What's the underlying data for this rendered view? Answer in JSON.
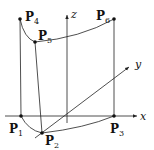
{
  "diagram": {
    "type": "3d-coordinate-surface-patch",
    "axes": {
      "x": {
        "label": "x"
      },
      "y": {
        "label": "y"
      },
      "z": {
        "label": "z"
      }
    },
    "points": [
      {
        "id": "P1",
        "base": "P",
        "sub": "1"
      },
      {
        "id": "P2",
        "base": "P",
        "sub": "2"
      },
      {
        "id": "P3",
        "base": "P",
        "sub": "3"
      },
      {
        "id": "P4",
        "base": "P",
        "sub": "4"
      },
      {
        "id": "P5",
        "base": "P",
        "sub": "5"
      },
      {
        "id": "P6",
        "base": "P",
        "sub": "6"
      }
    ],
    "colors": {
      "stroke": "#222222",
      "background": "#ffffff"
    }
  }
}
